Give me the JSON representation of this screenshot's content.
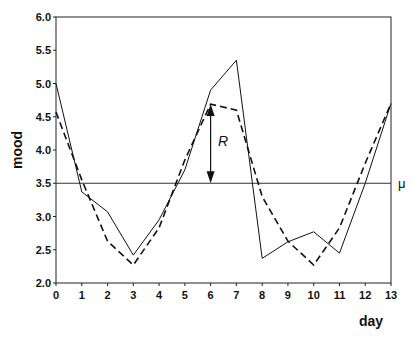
{
  "chart_data": {
    "type": "line",
    "title": "",
    "xlabel": "day",
    "ylabel": "mood",
    "xlim": [
      0,
      13
    ],
    "ylim": [
      2.0,
      6.0
    ],
    "x_ticks": [
      0,
      1,
      2,
      3,
      4,
      5,
      6,
      7,
      8,
      9,
      10,
      11,
      12,
      13
    ],
    "y_ticks": [
      "2.0",
      "2.5",
      "3.0",
      "3.5",
      "4.0",
      "4.5",
      "5.0",
      "5.5",
      "6.0"
    ],
    "x": [
      0,
      1,
      2,
      3,
      4,
      5,
      6,
      7,
      8,
      9,
      10,
      11,
      12,
      13
    ],
    "series": [
      {
        "name": "observed",
        "style": "solid",
        "values": [
          5.0,
          3.37,
          3.07,
          2.42,
          2.95,
          3.7,
          4.9,
          5.35,
          2.37,
          2.62,
          2.77,
          2.45,
          3.5,
          4.7
        ]
      },
      {
        "name": "fitted",
        "style": "dashed",
        "values": [
          4.57,
          3.55,
          2.63,
          2.27,
          2.83,
          3.85,
          4.69,
          4.6,
          3.3,
          2.63,
          2.27,
          2.83,
          3.8,
          4.7
        ]
      }
    ],
    "reference_line": {
      "label": "μ",
      "value": 3.5
    },
    "annotation": {
      "label": "R",
      "x": 6,
      "from": 3.5,
      "to": 4.69
    },
    "grid": false
  },
  "labels": {
    "xlabel": "day",
    "ylabel": "mood",
    "mu": "μ",
    "R": "R"
  }
}
